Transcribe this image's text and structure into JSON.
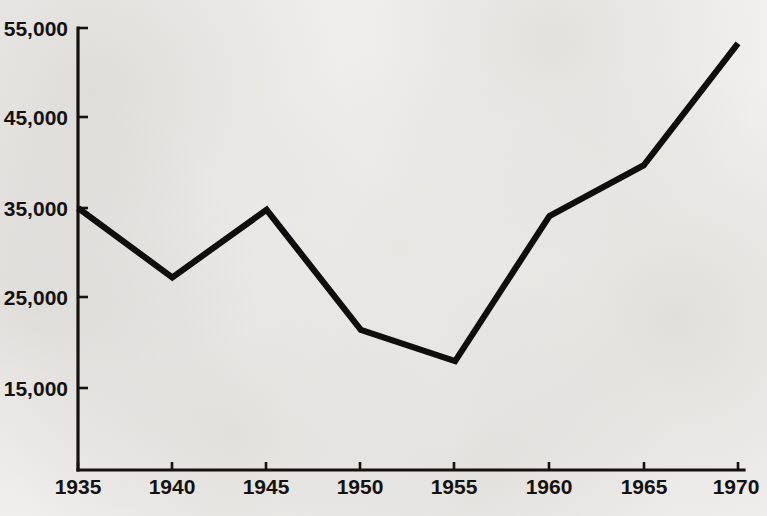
{
  "chart_data": {
    "type": "line",
    "title": "",
    "subtitle": "",
    "xlabel": "",
    "ylabel": "",
    "x": [
      1935,
      1940,
      1945,
      1950,
      1955,
      1960,
      1965,
      1970
    ],
    "values": [
      35000,
      27200,
      34800,
      21300,
      17800,
      34100,
      39800,
      53500
    ],
    "series": [
      {
        "name": "",
        "values": [
          35000,
          27200,
          34800,
          21300,
          17800,
          34100,
          39800,
          53500
        ]
      }
    ],
    "x_tick_labels": [
      "1935",
      "1940",
      "1945",
      "1950",
      "1955",
      "1960",
      "1965",
      "1970"
    ],
    "y_tick_labels": [
      "15,000",
      "25,000",
      "35,000",
      "45,000",
      "55,000"
    ],
    "y_tick_values": [
      15000,
      25000,
      35000,
      45000,
      55000
    ],
    "xlim": [
      1935,
      1970
    ],
    "ylim": [
      6000,
      57000
    ],
    "grid": false,
    "legend": false,
    "legend_position": "none",
    "line_color": "#100e0c",
    "background_color": "#f1f0ee",
    "axis_color": "#14110e"
  },
  "axis": {
    "y_labels": [
      {
        "text": "55,000"
      },
      {
        "text": "45,000"
      },
      {
        "text": "35,000"
      },
      {
        "text": "25,000"
      },
      {
        "text": "15,000"
      }
    ],
    "x_labels": [
      {
        "text": "1935"
      },
      {
        "text": "1940"
      },
      {
        "text": "1945"
      },
      {
        "text": "1950"
      },
      {
        "text": "1955"
      },
      {
        "text": "1960"
      },
      {
        "text": "1965"
      },
      {
        "text": "1970"
      }
    ]
  }
}
